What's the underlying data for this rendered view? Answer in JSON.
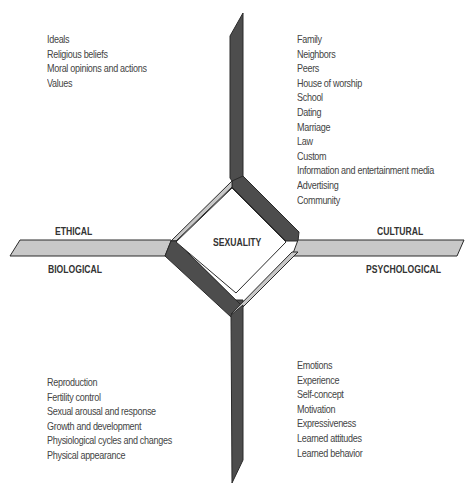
{
  "diagram": {
    "center": "SEXUALITY",
    "dimensions": {
      "ethical": "ETHICAL",
      "cultural": "CULTURAL",
      "biological": "BIOLOGICAL",
      "psychological": "PSYCHOLOGICAL"
    },
    "colors": {
      "dark_band": "#4d4d4d",
      "light_band": "#c8c8c8",
      "outline": "#2a2a2a",
      "text": "#444444"
    },
    "quadrants": {
      "ethical": {
        "position": "top-left",
        "items": [
          "Ideals",
          "Religious beliefs",
          "Moral opinions and actions",
          "Values"
        ]
      },
      "cultural": {
        "position": "top-right",
        "items": [
          "Family",
          "Neighbors",
          "Peers",
          "House of worship",
          "School",
          "Dating",
          "Marriage",
          "Law",
          "Custom",
          "Information and entertainment media",
          "Advertising",
          "Community"
        ]
      },
      "biological": {
        "position": "bottom-left",
        "items": [
          "Reproduction",
          "Fertility control",
          "Sexual arousal and response",
          "Growth and development",
          "Physiological cycles and changes",
          "Physical appearance"
        ]
      },
      "psychological": {
        "position": "bottom-right",
        "items": [
          "Emotions",
          "Experience",
          "Self-concept",
          "Motivation",
          "Expressiveness",
          "Learned attitudes",
          "Learned behavior"
        ]
      }
    }
  }
}
